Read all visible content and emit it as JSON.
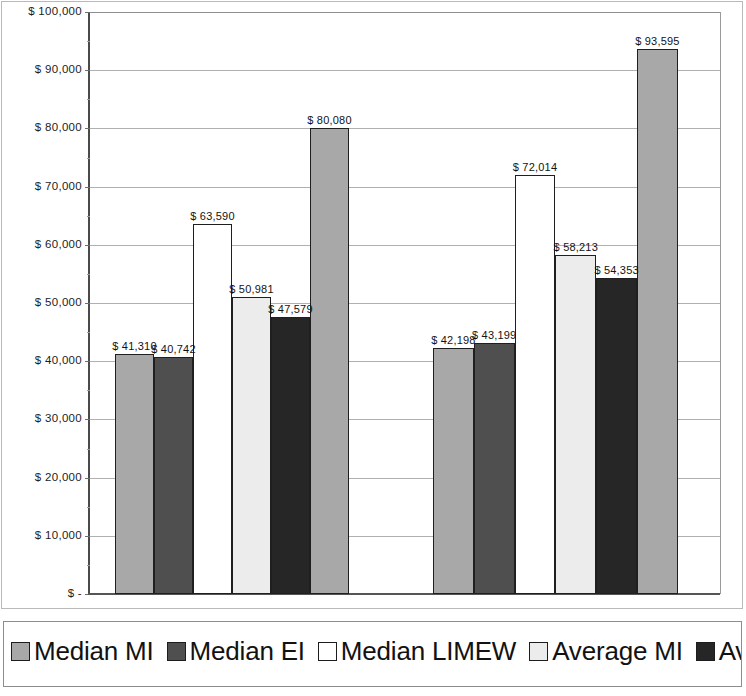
{
  "chart_data": {
    "type": "bar",
    "title": "",
    "xlabel": "",
    "ylabel": "",
    "ylim": [
      0,
      100000
    ],
    "grid": true,
    "legend_position": "bottom",
    "categories": [
      "Group 1",
      "Group 2"
    ],
    "series": [
      {
        "name": "Median MI",
        "color": "#a8a8a8",
        "values": [
          41310,
          42198
        ],
        "labels": [
          "$ 41,310",
          "$ 42,198"
        ]
      },
      {
        "name": "Median EI",
        "color": "#4f4f4f",
        "values": [
          40742,
          43199
        ],
        "labels": [
          "$ 40,742",
          "$ 43,199"
        ]
      },
      {
        "name": "Median LIMEW",
        "color": "#ffffff",
        "values": [
          63590,
          72014
        ],
        "labels": [
          "$ 63,590",
          "$ 72,014"
        ]
      },
      {
        "name": "Average MI",
        "color": "#ececec",
        "values": [
          50981,
          58213
        ],
        "labels": [
          "$ 50,981",
          "$ 58,213"
        ]
      },
      {
        "name": "Average EI",
        "color": "#262626",
        "values": [
          47579,
          54353
        ],
        "labels": [
          "$ 47,579",
          "$ 54,353"
        ]
      },
      {
        "name": "Average LIMEW",
        "color": "#a8a8a8",
        "values": [
          80080,
          93595
        ],
        "labels": [
          "$ 80,080",
          "$ 93,595"
        ]
      }
    ],
    "ytick_labels": [
      "$ 100,000",
      "$ 90,000",
      "$ 80,000",
      "$ 70,000",
      "$ 60,000",
      "$ 50,000",
      "$ 40,000",
      "$ 30,000",
      "$ 20,000",
      "$ 10,000",
      "$ -"
    ],
    "ytick_values": [
      100000,
      90000,
      80000,
      70000,
      60000,
      50000,
      40000,
      30000,
      20000,
      10000,
      0
    ]
  },
  "legend": {
    "items": [
      {
        "label": "Median MI"
      },
      {
        "label": "Median EI"
      },
      {
        "label": "Median LIMEW"
      },
      {
        "label": "Average MI"
      },
      {
        "label": "Avera"
      }
    ]
  },
  "axis": {
    "tick0": "$ 100,000",
    "tick1": "$ 90,000",
    "tick2": "$ 80,000",
    "tick3": "$ 70,000",
    "tick4": "$ 60,000",
    "tick5": "$ 50,000",
    "tick6": "$ 40,000",
    "tick7": "$ 30,000",
    "tick8": "$ 20,000",
    "tick9": "$ 10,000",
    "tick10": "$ -"
  },
  "bars": {
    "g1": {
      "b0": "$ 41,310",
      "b1": "$ 40,742",
      "b2": "$ 63,590",
      "b3": "$ 50,981",
      "b4": "$ 47,579",
      "b5": "$ 80,080"
    },
    "g2": {
      "b0": "$ 42,198",
      "b1": "$ 43,199",
      "b2": "$ 72,014",
      "b3": "$ 58,213",
      "b4": "$ 54,353",
      "b5": "$ 93,595"
    }
  }
}
